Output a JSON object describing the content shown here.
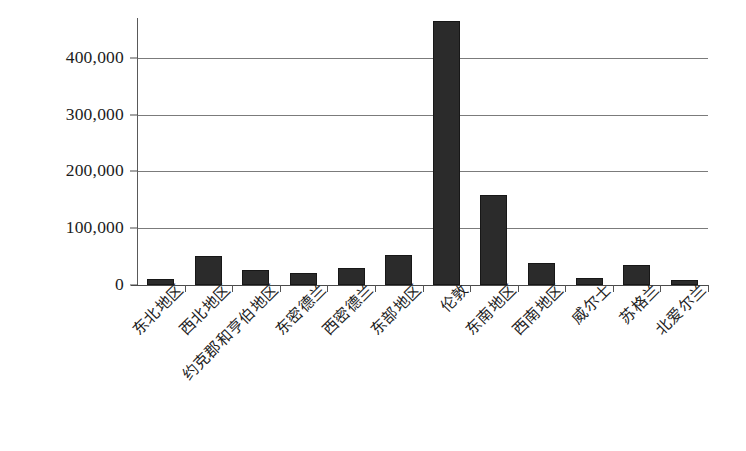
{
  "chart_data": {
    "type": "bar",
    "title": "",
    "xlabel": "",
    "ylabel": "",
    "grid": true,
    "legend": false,
    "ylim": [
      0,
      470000
    ],
    "yticks": [
      0,
      100000,
      200000,
      300000,
      400000
    ],
    "ytick_labels": [
      "0",
      "100,000",
      "200,000",
      "300,000",
      "400,000"
    ],
    "categories": [
      "东北地区",
      "西北地区",
      "约克郡和亨伯地区",
      "东密德兰",
      "西密德兰",
      "东部地区",
      "伦敦",
      "东南地区",
      "西南地区",
      "威尔士",
      "苏格兰",
      "北爱尔兰"
    ],
    "values": [
      11000,
      51000,
      26000,
      21000,
      30000,
      52000,
      464000,
      158000,
      39000,
      12000,
      36000,
      8000
    ],
    "bar_color": "#2b2b2b",
    "axis_color": "#4a4a4a",
    "gridline_color": "#7b7b7b"
  }
}
